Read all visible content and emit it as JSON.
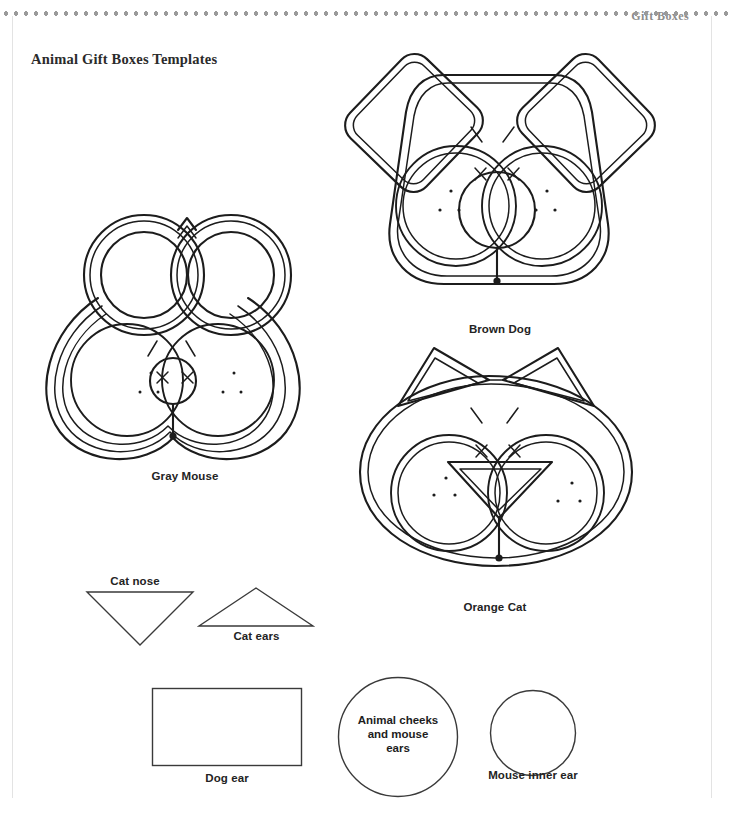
{
  "page": {
    "running_head": "Gift Boxes",
    "title": "Animal Gift Boxes Templates",
    "background_color": "#ffffff",
    "ink_color": "#1c1c1c",
    "rule_color": "#9a9a9a"
  },
  "figures": [
    {
      "id": "gray-mouse",
      "caption": "Gray Mouse",
      "ear_shape": "circle",
      "nose_shape": "circle"
    },
    {
      "id": "brown-dog",
      "caption": "Brown Dog",
      "ear_shape": "rounded-rectangle",
      "nose_shape": "circle"
    },
    {
      "id": "orange-cat",
      "caption": "Orange Cat",
      "ear_shape": "triangle",
      "nose_shape": "triangle"
    }
  ],
  "templates": [
    {
      "id": "cat-nose",
      "label": "Cat nose",
      "label_position": "above",
      "shape": "triangle-down"
    },
    {
      "id": "cat-ears",
      "label": "Cat ears",
      "label_position": "below",
      "shape": "triangle-up"
    },
    {
      "id": "dog-ear",
      "label": "Dog ear",
      "label_position": "below",
      "shape": "rectangle"
    },
    {
      "id": "animal-cheeks",
      "label": "Animal cheeks\nand mouse\nears",
      "label_position": "inside",
      "shape": "circle"
    },
    {
      "id": "mouse-inner-ear",
      "label": "Mouse\ninner ear",
      "label_position": "below",
      "shape": "circle"
    }
  ]
}
